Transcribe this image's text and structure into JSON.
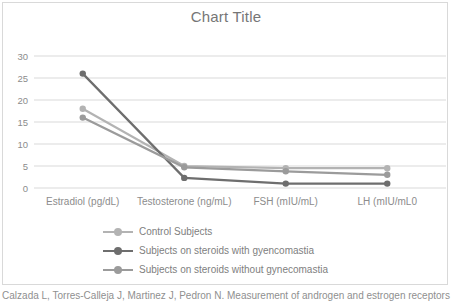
{
  "page": {
    "citation": "Calzada L, Torres-Calleja J, Martinez J, Pedron N. Measurement of androgen and estrogen receptors"
  },
  "chart_data": {
    "type": "line",
    "title": "Chart Title",
    "xlabel": "",
    "ylabel": "",
    "categories": [
      "Estradiol (pg/dL)",
      "Testosterone (ng/mL)",
      "FSH (mIU/mL)",
      "LH (mIU/mL0"
    ],
    "series": [
      {
        "name": "Control Subjects",
        "color": "#b3b3b3",
        "values": [
          18,
          5,
          4.5,
          4.5
        ]
      },
      {
        "name": "Subjects on steroids with gyencomastia",
        "color": "#6e6e6e",
        "values": [
          26,
          2.3,
          1,
          1
        ]
      },
      {
        "name": "Subjects on steroids without gynecomastia",
        "color": "#9b9b9b",
        "values": [
          16,
          4.7,
          3.8,
          3
        ]
      }
    ],
    "ylim": [
      0,
      30
    ],
    "yticks": [
      0,
      5,
      10,
      15,
      20,
      25,
      30
    ],
    "grid": true,
    "gridline_color": "#d9d9d9",
    "tick_label_color": "#8c8c8c",
    "legend_position": "bottom-left"
  }
}
